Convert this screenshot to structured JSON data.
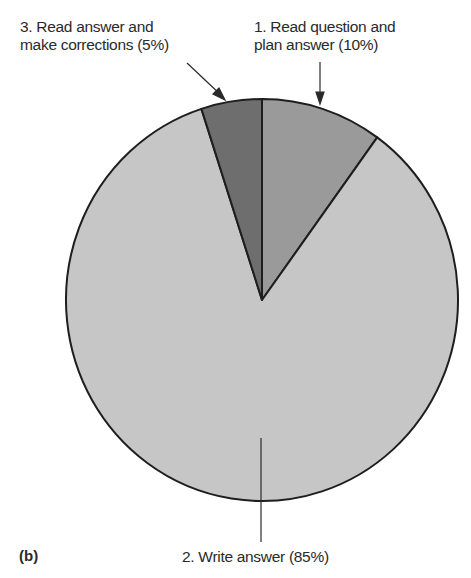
{
  "chart_data": {
    "type": "pie",
    "title": "",
    "panel_label": "(b)",
    "categories": [
      "1. Read question and plan answer",
      "2. Write answer",
      "3. Read answer and make corrections"
    ],
    "values": [
      10,
      85,
      5
    ],
    "unit": "%",
    "start_angle_deg": 0,
    "direction": "clockwise",
    "colors": [
      "#9a9a9a",
      "#c6c6c6",
      "#6e6e6e"
    ],
    "annotations": [
      {
        "slice": 0,
        "text_lines": [
          "1. Read question and",
          "plan answer (10%)"
        ]
      },
      {
        "slice": 1,
        "text_lines": [
          "2. Write answer (85%)"
        ]
      },
      {
        "slice": 2,
        "text_lines": [
          "3. Read answer and",
          "make corrections (5%)"
        ]
      }
    ]
  },
  "labels": {
    "slice1_line1": "1. Read question and",
    "slice1_line2": "plan answer (10%)",
    "slice2_line1": "2. Write answer (85%)",
    "slice3_line1": "3. Read answer and",
    "slice3_line2": "make corrections (5%)",
    "panel": "(b)"
  }
}
